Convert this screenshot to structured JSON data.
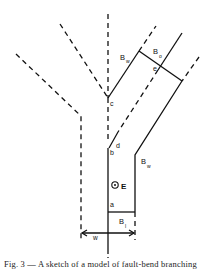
{
  "figure": {
    "labels": {
      "a": "a",
      "b": "b",
      "c": "c",
      "d": "d",
      "e": "e",
      "E": "E",
      "B_w_top": "B",
      "B_w_top_sub": "w",
      "B_o": "B",
      "B_o_sub": "o",
      "B_w_right": "B",
      "B_w_right_sub": "w",
      "B_l": "B",
      "B_l_sub": "l",
      "w": "w"
    },
    "caption": "Fig. 3 — A sketch of a model of fault-bend branching"
  },
  "colors": {
    "line": "#111111",
    "background": "#ffffff"
  }
}
